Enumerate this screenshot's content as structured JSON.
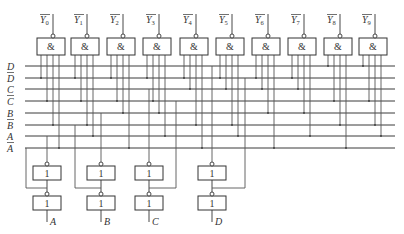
{
  "colors": {
    "line": "#3a3a3a",
    "wire": "#555555",
    "gate_stroke": "#333333",
    "bg": "#ffffff"
  },
  "outputs": [
    {
      "label": "Y",
      "sub": "0",
      "inverted": true,
      "minterm": 0
    },
    {
      "label": "Y",
      "sub": "1",
      "inverted": true,
      "minterm": 1
    },
    {
      "label": "Y",
      "sub": "2",
      "inverted": true,
      "minterm": 2
    },
    {
      "label": "Y",
      "sub": "3",
      "inverted": true,
      "minterm": 3
    },
    {
      "label": "Y",
      "sub": "4",
      "inverted": true,
      "minterm": 4
    },
    {
      "label": "Y",
      "sub": "5",
      "inverted": true,
      "minterm": 5
    },
    {
      "label": "Y",
      "sub": "6",
      "inverted": true,
      "minterm": 6
    },
    {
      "label": "Y",
      "sub": "7",
      "inverted": true,
      "minterm": 7
    },
    {
      "label": "Y",
      "sub": "8",
      "inverted": true,
      "minterm": 8
    },
    {
      "label": "Y",
      "sub": "9",
      "inverted": true,
      "minterm": 9
    }
  ],
  "and_gate_symbol": "&",
  "inverter_symbol": "1",
  "buses": [
    {
      "label": "D",
      "inverted": false
    },
    {
      "label": "D",
      "inverted": true
    },
    {
      "label": "C",
      "inverted": false
    },
    {
      "label": "C",
      "inverted": true
    },
    {
      "label": "B",
      "inverted": false
    },
    {
      "label": "B",
      "inverted": true
    },
    {
      "label": "A",
      "inverted": false
    },
    {
      "label": "A",
      "inverted": true
    }
  ],
  "inputs": [
    {
      "label": "A"
    },
    {
      "label": "B"
    },
    {
      "label": "C"
    },
    {
      "label": "D"
    }
  ]
}
